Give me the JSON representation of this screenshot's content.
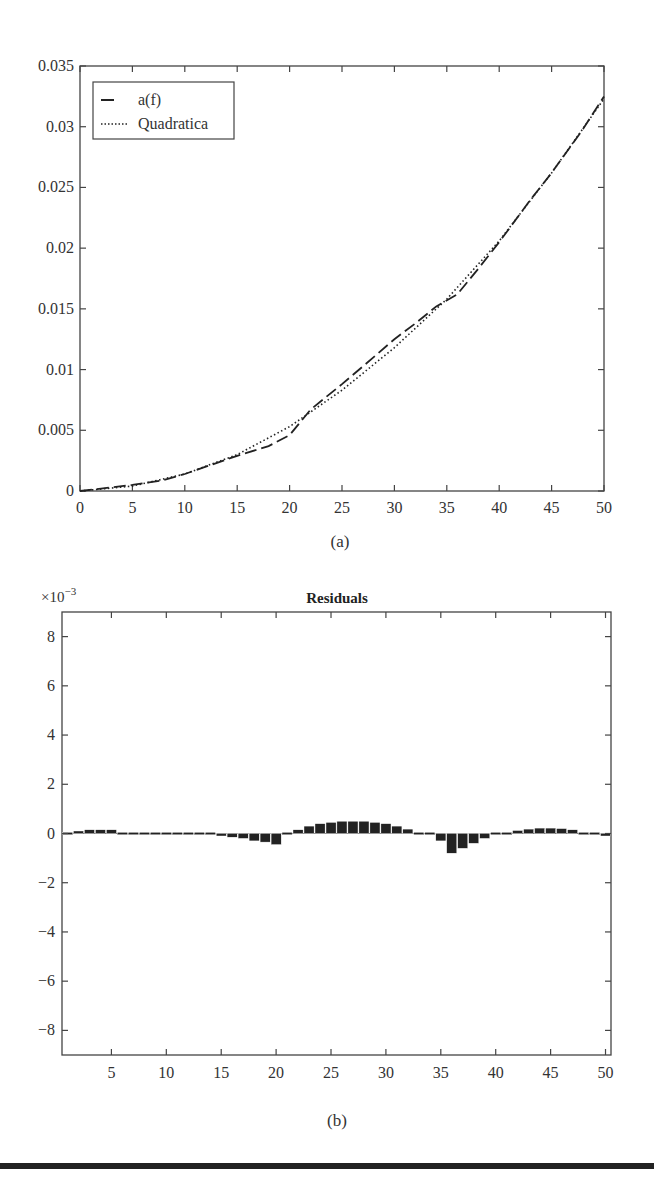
{
  "chart_data": [
    {
      "type": "line",
      "panel_label": "(a)",
      "title": "",
      "xlabel": "",
      "ylabel": "",
      "xlim": [
        0,
        50
      ],
      "ylim": [
        0,
        0.035
      ],
      "xticks": [
        0,
        5,
        10,
        15,
        20,
        25,
        30,
        35,
        40,
        45,
        50
      ],
      "yticks": [
        0,
        0.005,
        0.01,
        0.015,
        0.02,
        0.025,
        0.03,
        0.035
      ],
      "ytick_labels": [
        "0",
        "0.005",
        "0.01",
        "0.015",
        "0.02",
        "0.025",
        "0.03",
        "0.035"
      ],
      "grid": false,
      "legend_position": "upper left",
      "legend": [
        "a(f)",
        "Quadratica"
      ],
      "series": [
        {
          "name": "a(f)",
          "style": "dashed",
          "x": [
            0,
            2,
            5,
            8,
            10,
            12,
            15,
            18,
            20,
            22,
            25,
            28,
            30,
            32,
            34,
            36,
            38,
            40,
            43,
            45,
            48,
            50
          ],
          "y": [
            0,
            0.0002,
            0.0005,
            0.0009,
            0.0014,
            0.002,
            0.0029,
            0.0037,
            0.0046,
            0.0067,
            0.0088,
            0.011,
            0.0125,
            0.0138,
            0.0152,
            0.0162,
            0.0183,
            0.0205,
            0.024,
            0.0262,
            0.0298,
            0.0325
          ]
        },
        {
          "name": "Quadratica",
          "style": "dotted",
          "x": [
            0,
            5,
            10,
            15,
            20,
            25,
            30,
            35,
            40,
            45,
            50
          ],
          "y": [
            0,
            0.0004,
            0.0014,
            0.003,
            0.0053,
            0.0083,
            0.0118,
            0.0158,
            0.0206,
            0.0262,
            0.0323
          ]
        }
      ]
    },
    {
      "type": "bar",
      "panel_label": "(b)",
      "title": "Residuals",
      "y_multiplier": "×10−3",
      "xlim": [
        0.5,
        50.5
      ],
      "ylim": [
        -9,
        9
      ],
      "xticks": [
        5,
        10,
        15,
        20,
        25,
        30,
        35,
        40,
        45,
        50
      ],
      "yticks": [
        -8,
        -6,
        -4,
        -2,
        0,
        2,
        4,
        6,
        8
      ],
      "ytick_labels": [
        "−8",
        "−6",
        "−4",
        "−2",
        "0",
        "2",
        "4",
        "6",
        "8"
      ],
      "grid": false,
      "x": [
        1,
        2,
        3,
        4,
        5,
        6,
        7,
        8,
        9,
        10,
        11,
        12,
        13,
        14,
        15,
        16,
        17,
        18,
        19,
        20,
        21,
        22,
        23,
        24,
        25,
        26,
        27,
        28,
        29,
        30,
        31,
        32,
        33,
        34,
        35,
        36,
        37,
        38,
        39,
        40,
        41,
        42,
        43,
        44,
        45,
        46,
        47,
        48,
        49,
        50
      ],
      "values": [
        0.05,
        0.1,
        0.15,
        0.15,
        0.15,
        0.05,
        -0.03,
        -0.03,
        -0.03,
        -0.03,
        -0.03,
        -0.03,
        -0.04,
        -0.06,
        -0.1,
        -0.15,
        -0.2,
        -0.3,
        -0.35,
        -0.45,
        0.05,
        0.15,
        0.3,
        0.4,
        0.45,
        0.5,
        0.5,
        0.5,
        0.45,
        0.4,
        0.3,
        0.18,
        0.05,
        -0.08,
        -0.3,
        -0.8,
        -0.6,
        -0.4,
        -0.2,
        -0.05,
        0.05,
        0.12,
        0.18,
        0.22,
        0.22,
        0.2,
        0.15,
        0.08,
        0.0,
        -0.1
      ]
    }
  ],
  "panels": {
    "a": {
      "caption": "(a)",
      "legend": [
        {
          "label": "a(f)"
        },
        {
          "label": "Quadratica"
        }
      ]
    },
    "b": {
      "caption": "(b)",
      "title": "Residuals",
      "multiplier_base": "×10",
      "multiplier_exp": "−3"
    }
  }
}
